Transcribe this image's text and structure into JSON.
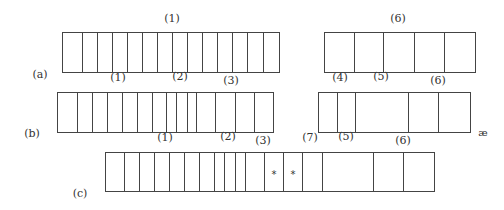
{
  "diagram": {
    "rows": [
      {
        "id": "a",
        "label": "(a)",
        "blocks": [
          {
            "name": "a-left",
            "cell_count": 14
          },
          {
            "name": "a-right",
            "cell_count": 5
          }
        ],
        "top_labels": [
          "(1)",
          "(6)"
        ]
      },
      {
        "id": "b",
        "label": "(b)",
        "blocks": [
          {
            "name": "b-left",
            "cell_count": 14
          },
          {
            "name": "b-right",
            "cell_count": 5
          }
        ],
        "top_labels": [
          "(1)",
          "(2)",
          "(3)",
          "(4)",
          "(5)",
          "(6)"
        ],
        "trailing_mark": "æ"
      },
      {
        "id": "c",
        "label": "(c)",
        "blocks": [
          {
            "name": "c-main",
            "cell_count": 17,
            "marked_cells": [
              11,
              12
            ],
            "mark": "*"
          }
        ],
        "top_labels": [
          "(1)",
          "(2)",
          "(3)",
          "(7)",
          "(5)",
          "(6)"
        ]
      }
    ]
  }
}
